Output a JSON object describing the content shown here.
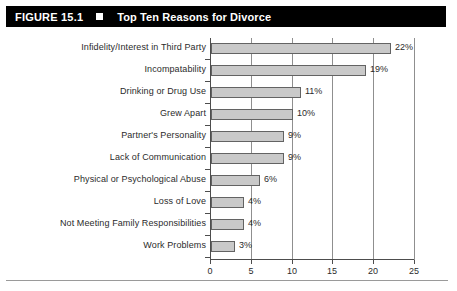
{
  "header": {
    "figure_number": "FIGURE 15.1",
    "marker_icon": "filled-square-icon",
    "title": "Top Ten Reasons for Divorce",
    "background_color": "#000000",
    "text_color": "#ffffff"
  },
  "chart_data": {
    "type": "bar",
    "orientation": "horizontal",
    "title": "Top Ten Reasons for Divorce",
    "xlabel": "",
    "ylabel": "",
    "xlim": [
      0,
      25
    ],
    "xticks": [
      0,
      5,
      10,
      15,
      20,
      25
    ],
    "xtick_labels": [
      "0",
      "5",
      "10",
      "15",
      "20",
      "25"
    ],
    "grid": "vertical",
    "legend": "none",
    "bar_fill_color": "#c9c9c9",
    "bar_edge_color": "#636363",
    "categories": [
      "Infidelity/Interest in Third Party",
      "Incompatability",
      "Drinking or Drug Use",
      "Grew Apart",
      "Partner's Personality",
      "Lack of Communication",
      "Physical or Psychological Abuse",
      "Loss of Love",
      "Not Meeting Family Responsibilities",
      "Work Problems"
    ],
    "values": [
      22,
      19,
      11,
      10,
      9,
      9,
      6,
      4,
      4,
      3
    ],
    "data_labels": [
      "22%",
      "19%",
      "11%",
      "10%",
      "9%",
      "9%",
      "6%",
      "4%",
      "4%",
      "3%"
    ]
  }
}
